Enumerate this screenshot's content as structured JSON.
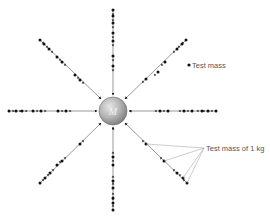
{
  "diagram": {
    "central_mass": {
      "label": "M",
      "cx": 113,
      "cy": 111,
      "r": 14,
      "colors": {
        "highlight": "#e6e6e6",
        "mid": "#b4b4b4",
        "edge": "#7a7a7a"
      }
    },
    "labels": {
      "test_mass": "Test mass",
      "test_mass_1kg": "Test mass of 1 kg"
    },
    "colors": {
      "line": "#555555",
      "dot": "#111111",
      "leader": "#9a9a9a"
    },
    "field_lines": [
      {
        "name": "top",
        "from": [
          113,
          10
        ],
        "to": [
          113,
          95
        ],
        "dots": [
          [
            113,
            10
          ],
          [
            113,
            16
          ],
          [
            113,
            23
          ],
          [
            113,
            33
          ],
          [
            113,
            41
          ],
          [
            113,
            56
          ],
          [
            113,
            66
          ]
        ]
      },
      {
        "name": "bottom",
        "from": [
          113,
          211
        ],
        "to": [
          113,
          127
        ],
        "dots": [
          [
            113,
            157
          ],
          [
            113,
            165
          ],
          [
            113,
            181
          ],
          [
            113,
            188
          ],
          [
            113,
            198
          ],
          [
            113,
            203
          ],
          [
            113,
            210
          ]
        ]
      },
      {
        "name": "left",
        "from": [
          9,
          111
        ],
        "to": [
          97,
          111
        ],
        "dots": [
          [
            9,
            111
          ],
          [
            16,
            111
          ],
          [
            22,
            111
          ],
          [
            33,
            111
          ],
          [
            41,
            111
          ],
          [
            58,
            111
          ],
          [
            66,
            111
          ]
        ]
      },
      {
        "name": "right",
        "from": [
          216,
          111
        ],
        "to": [
          129,
          111
        ],
        "dots": [
          [
            160,
            111
          ],
          [
            168,
            111
          ],
          [
            184,
            111
          ],
          [
            192,
            111
          ],
          [
            202,
            111
          ],
          [
            208,
            111
          ],
          [
            216,
            111
          ]
        ]
      },
      {
        "name": "upper-left",
        "from": [
          40,
          40
        ],
        "to": [
          101,
          99
        ],
        "dots": [
          [
            40,
            40
          ],
          [
            44,
            44
          ],
          [
            49,
            49
          ],
          [
            57,
            57
          ],
          [
            62,
            62
          ],
          [
            75,
            75
          ],
          [
            80,
            80
          ]
        ]
      },
      {
        "name": "upper-right",
        "from": [
          186,
          40
        ],
        "to": [
          125,
          99
        ],
        "dots": [
          [
            186,
            40
          ],
          [
            182,
            44
          ],
          [
            177,
            49
          ],
          [
            165,
            62
          ],
          [
            158,
            72
          ],
          [
            146,
            79
          ]
        ]
      },
      {
        "name": "lower-left",
        "from": [
          40,
          183
        ],
        "to": [
          101,
          123
        ],
        "dots": [
          [
            40,
            183
          ],
          [
            45,
            178
          ],
          [
            50,
            173
          ],
          [
            57,
            165
          ],
          [
            62,
            161
          ],
          [
            80,
            144
          ]
        ]
      },
      {
        "name": "lower-right",
        "from": [
          187,
          183
        ],
        "to": [
          125,
          123
        ],
        "dots": [
          [
            146,
            144
          ],
          [
            164,
            161
          ],
          [
            177,
            173
          ],
          [
            183,
            178
          ],
          [
            187,
            183
          ]
        ]
      }
    ],
    "test_mass_marker": {
      "x": 189,
      "y": 65
    },
    "leader_point": {
      "x": 204,
      "y": 148
    }
  }
}
